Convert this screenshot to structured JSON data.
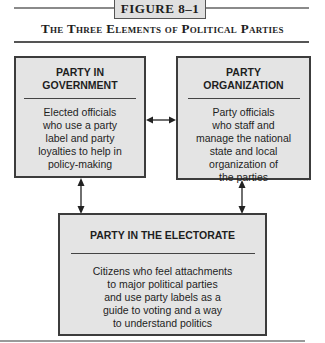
{
  "figure": {
    "label": "FIGURE 8–1",
    "title": "The Three Elements of Political Parties"
  },
  "boxes": {
    "government": {
      "heading_line1": "PARTY IN",
      "heading_line2": "GOVERNMENT",
      "body": [
        "Elected officials",
        "who use a party",
        "label and party",
        "loyalties to help in",
        "policy-making"
      ]
    },
    "organization": {
      "heading_line1": "PARTY",
      "heading_line2": "ORGANIZATION",
      "body": [
        "Party officials",
        "who staff and",
        "manage the national",
        "state and local",
        "organization of",
        "the parties"
      ]
    },
    "electorate": {
      "heading": "PARTY IN THE ELECTORATE",
      "body": [
        "Citizens who feel attachments",
        "to major political parties",
        "and use party labels as a",
        "guide to voting and a way",
        "to understand politics"
      ]
    }
  },
  "connectors": [
    {
      "from": "government",
      "to": "organization",
      "type": "double-arrow"
    },
    {
      "from": "government",
      "to": "electorate",
      "type": "double-arrow"
    },
    {
      "from": "organization",
      "to": "electorate",
      "type": "double-arrow"
    }
  ],
  "colors": {
    "box_fill": "#e4e4e4",
    "box_border": "#3c3c3c",
    "rule": "#8a8a8a",
    "text": "#1e1e1e"
  }
}
